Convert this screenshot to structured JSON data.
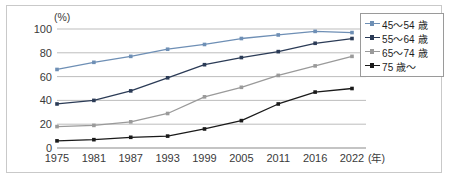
{
  "chart_data": {
    "type": "line",
    "title": "",
    "xlabel": "(年)",
    "ylabel": "(%)",
    "ylim": [
      0,
      100
    ],
    "yticks": [
      0,
      20,
      40,
      60,
      80,
      100
    ],
    "grid": true,
    "legend_position": "top-right",
    "categories": [
      "1975",
      "1981",
      "1987",
      "1993",
      "1999",
      "2005",
      "2011",
      "2016",
      "2022"
    ],
    "series": [
      {
        "name": "45〜54 歳",
        "color": "#6e8fb5",
        "values": [
          66,
          72,
          77,
          83,
          87,
          92,
          95,
          98,
          97
        ]
      },
      {
        "name": "55〜64 歳",
        "color": "#2b3b56",
        "values": [
          37,
          40,
          48,
          59,
          70,
          76,
          81,
          88,
          92
        ]
      },
      {
        "name": "65〜74 歳",
        "color": "#9a9a9a",
        "values": [
          18,
          19,
          22,
          29,
          43,
          51,
          61,
          69,
          77
        ]
      },
      {
        "name": "75 歳〜",
        "color": "#1a1a1a",
        "values": [
          6,
          7,
          9,
          10,
          16,
          23,
          37,
          47,
          50
        ]
      }
    ]
  },
  "axes": {
    "y_unit": "(%)",
    "x_unit": "(年)",
    "ytick_labels": [
      "100",
      "80",
      "60",
      "40",
      "20",
      "0"
    ],
    "xtick_labels": [
      "1975",
      "1981",
      "1987",
      "1993",
      "1999",
      "2005",
      "2011",
      "2016",
      "2022"
    ]
  },
  "legend": {
    "items": [
      {
        "label": "45〜54 歳",
        "color": "#6e8fb5"
      },
      {
        "label": "55〜64 歳",
        "color": "#2b3b56"
      },
      {
        "label": "65〜74 歳",
        "color": "#9a9a9a"
      },
      {
        "label": "75 歳〜",
        "color": "#1a1a1a"
      }
    ]
  },
  "colors": {
    "grid": "#b6b6b6",
    "axis": "#8a8a8a",
    "frame": "#c9c9c9",
    "text": "#3a3a3a"
  }
}
